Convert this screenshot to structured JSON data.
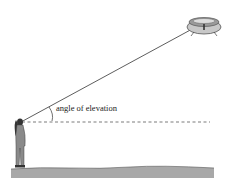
{
  "diagram": {
    "annotation": "angle of elevation",
    "elements": [
      "observer",
      "ufo",
      "line-of-sight",
      "horizontal-reference-line",
      "ground",
      "angle-arc"
    ],
    "colors": {
      "line": "#333333",
      "ground": "#a8a8a8",
      "ufo_body": "#b8b8b8",
      "ufo_rim": "#555555",
      "figure": "#8a8a8a",
      "hair": "#333333"
    }
  }
}
